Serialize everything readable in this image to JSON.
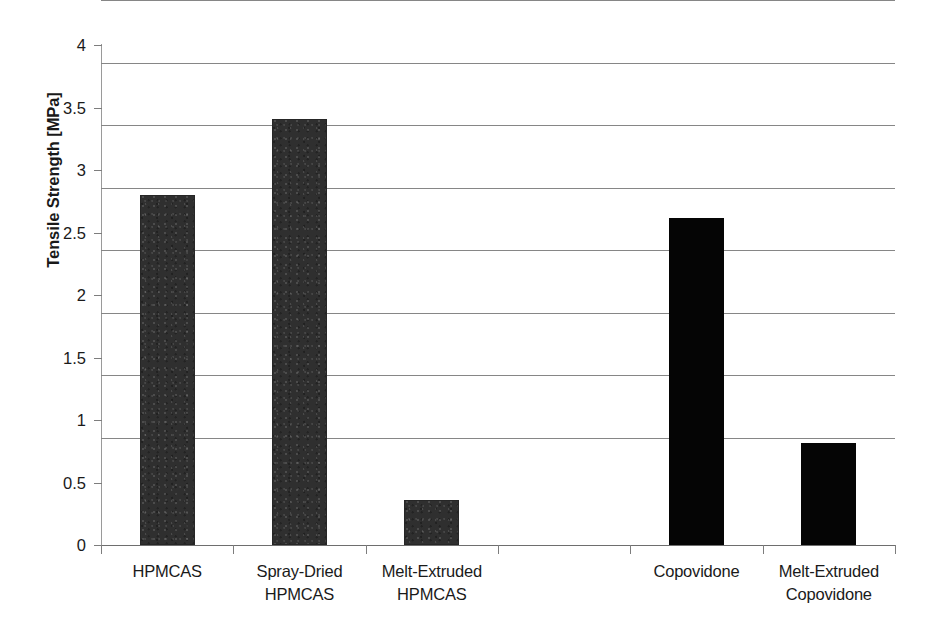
{
  "chart_data": {
    "type": "bar",
    "title": "",
    "xlabel": "",
    "ylabel": "Tensile Strength [MPa]",
    "ylim": [
      0,
      4
    ],
    "ytick_labels": [
      "4",
      "3.5",
      "3",
      "2.5",
      "2",
      "1.5",
      "1",
      "0.5",
      "0"
    ],
    "ytick_values": [
      4,
      3.5,
      3,
      2.5,
      2,
      1.5,
      1,
      0.5,
      0
    ],
    "grid": true,
    "legend": "none",
    "categories": [
      "HPMCAS",
      "Spray-Dried HPMCAS",
      "Melt-Extruded HPMCAS",
      "",
      "Copovidone",
      "Melt-Extruded Copovidone"
    ],
    "values": [
      2.8,
      3.41,
      0.36,
      null,
      2.62,
      0.82
    ],
    "bars": [
      {
        "label_line1": "HPMCAS",
        "label_line2": "",
        "value": 2.8,
        "style": "textured"
      },
      {
        "label_line1": "Spray-Dried",
        "label_line2": "HPMCAS",
        "value": 3.41,
        "style": "textured"
      },
      {
        "label_line1": "Melt-Extruded",
        "label_line2": "HPMCAS",
        "value": 0.36,
        "style": "textured"
      },
      {
        "label_line1": "",
        "label_line2": "",
        "value": null,
        "style": "empty"
      },
      {
        "label_line1": "Copovidone",
        "label_line2": "",
        "value": 2.62,
        "style": "solid"
      },
      {
        "label_line1": "Melt-Extruded",
        "label_line2": "Copovidone",
        "value": 0.82,
        "style": "solid"
      }
    ],
    "colors": {
      "bar_textured": "#2f2f2f",
      "bar_solid": "#050505",
      "gridline": "#868686",
      "axis": "#7d7d7d",
      "text": "#1a1a1a",
      "background": "#ffffff"
    }
  }
}
